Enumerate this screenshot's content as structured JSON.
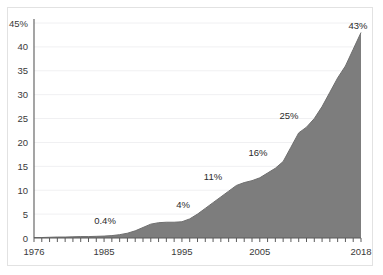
{
  "chart_data": {
    "type": "area",
    "title": "",
    "subtitle": "",
    "xlabel": "",
    "ylabel": "",
    "xlim": [
      1976,
      2018
    ],
    "ylim": [
      0,
      45
    ],
    "grid": true,
    "legend_position": "none",
    "y_ticks": [
      "0",
      "5",
      "10",
      "15",
      "20",
      "25",
      "30",
      "35",
      "40",
      "45%"
    ],
    "y_tick_values": [
      0,
      5,
      10,
      15,
      20,
      25,
      30,
      35,
      40,
      45
    ],
    "x_ticks": [
      "1976",
      "1985",
      "1995",
      "2005",
      "2018"
    ],
    "x_tick_values": [
      1976,
      1985,
      1995,
      2005,
      2018
    ],
    "x_minor_tick_interval": 1,
    "series": [
      {
        "name": "share",
        "color": "#7d7d7d",
        "x": [
          1976,
          1977,
          1978,
          1979,
          1980,
          1981,
          1982,
          1983,
          1984,
          1985,
          1986,
          1987,
          1988,
          1989,
          1990,
          1991,
          1992,
          1993,
          1994,
          1995,
          1996,
          1997,
          1998,
          1999,
          2000,
          2001,
          2002,
          2003,
          2004,
          2005,
          2006,
          2007,
          2008,
          2009,
          2010,
          2011,
          2012,
          2013,
          2014,
          2015,
          2016,
          2017,
          2018
        ],
        "values": [
          0.1,
          0.1,
          0.15,
          0.2,
          0.2,
          0.25,
          0.3,
          0.3,
          0.35,
          0.4,
          0.5,
          0.7,
          1.0,
          1.5,
          2.2,
          2.9,
          3.2,
          3.3,
          3.3,
          3.4,
          4.0,
          5.0,
          6.2,
          7.4,
          8.6,
          9.8,
          11.0,
          11.6,
          12.0,
          12.6,
          13.6,
          14.6,
          16.0,
          19.0,
          22.0,
          23.2,
          25.0,
          27.5,
          30.5,
          33.5,
          36.0,
          39.5,
          43.0
        ]
      }
    ],
    "annotations": [
      {
        "label": "0.4%",
        "year": 1985,
        "value": 0.4,
        "lx": 105,
        "ly": 224
      },
      {
        "label": "4%",
        "year": 1996,
        "value": 4.0,
        "lx": 183,
        "ly": 208
      },
      {
        "label": "11%",
        "year": 2002,
        "value": 11.0,
        "lx": 213,
        "ly": 180
      },
      {
        "label": "16%",
        "year": 2008,
        "value": 16.0,
        "lx": 258,
        "ly": 156
      },
      {
        "label": "25%",
        "year": 2012,
        "value": 25.0,
        "lx": 289,
        "ly": 119
      },
      {
        "label": "43%",
        "year": 2018,
        "value": 43.0,
        "lx": 358,
        "ly": 29
      }
    ]
  }
}
